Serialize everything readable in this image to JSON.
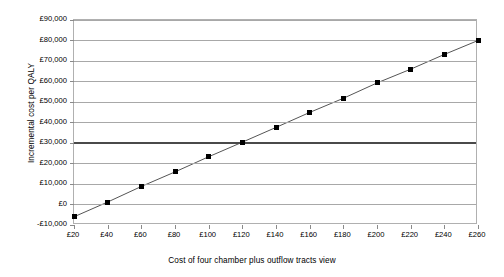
{
  "chart_data": {
    "type": "line",
    "title": "",
    "xlabel": "Cost of four chamber plus outflow tracts view",
    "ylabel": "Incremental cost per QALY",
    "x": [
      20,
      40,
      60,
      80,
      100,
      120,
      140,
      160,
      180,
      200,
      220,
      240,
      260
    ],
    "values": [
      -6000,
      1200,
      8800,
      15900,
      23300,
      30400,
      37600,
      44900,
      51800,
      59300,
      66000,
      73200,
      80000
    ],
    "series": [
      {
        "name": "Incremental cost per QALY",
        "values": [
          -6000,
          1200,
          8800,
          15900,
          23300,
          30400,
          37600,
          44900,
          51800,
          59300,
          66000,
          73200,
          80000
        ]
      }
    ],
    "xlim": [
      20,
      260
    ],
    "ylim": [
      -10000,
      90000
    ],
    "xtick_labels": [
      "£20",
      "£40",
      "£60",
      "£80",
      "£100",
      "£120",
      "£140",
      "£160",
      "£180",
      "£200",
      "£220",
      "£240",
      "£260"
    ],
    "ytick_labels": [
      "£90,000",
      "£80,000",
      "£70,000",
      "£60,000",
      "£50,000",
      "£40,000",
      "£30,000",
      "£20,000",
      "£10,000",
      "£0",
      "-£10,000"
    ],
    "ytick_values": [
      90000,
      80000,
      70000,
      60000,
      50000,
      40000,
      30000,
      20000,
      10000,
      0,
      -10000
    ],
    "grid": true,
    "legend": "none",
    "annotations": [
      {
        "name": "threshold-line",
        "value": 30000,
        "label": "",
        "color": "#4a4a4a"
      }
    ],
    "colors": {
      "series_line": "#555555",
      "marker": "#000000",
      "gridline": "#a8a8a8",
      "plot_border": "#b0b0b0",
      "threshold": "#4a4a4a",
      "background": "#ffffff"
    }
  }
}
